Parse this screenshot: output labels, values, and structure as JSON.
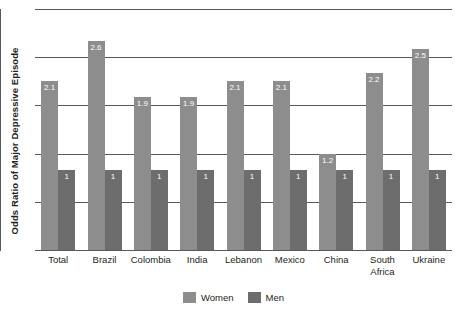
{
  "chart_data": {
    "type": "bar",
    "title": "",
    "subtitle": "",
    "xlabel": "",
    "ylabel": "Odds Ratio of Major Depressive Episode",
    "categories": [
      "Total",
      "Brazil",
      "Colombia",
      "India",
      "Lebanon",
      "Mexico",
      "China",
      "South\nAfrica",
      "Ukraine"
    ],
    "series": [
      {
        "name": "Women",
        "color": "#8d8d8d",
        "values": [
          2.1,
          2.6,
          1.9,
          1.9,
          2.1,
          2.1,
          1.2,
          2.2,
          2.5
        ],
        "labels": [
          "2.1",
          "2.6",
          "1.9",
          "1.9",
          "2.1",
          "2.1",
          "1.2",
          "2.2",
          "2.5"
        ]
      },
      {
        "name": "Men",
        "color": "#6d6d6d",
        "values": [
          1,
          1,
          1,
          1,
          1,
          1,
          1,
          1,
          1
        ],
        "labels": [
          "1",
          "1",
          "1",
          "1",
          "1",
          "1",
          "1",
          "1",
          "1"
        ]
      }
    ],
    "ylim": [
      0,
      3.0
    ],
    "yticks": [
      0,
      0.6,
      1.2,
      1.8,
      2.4,
      3.0
    ],
    "ytick_labels": [
      "",
      "",
      "",
      "",
      "",
      ""
    ],
    "grid": true,
    "legend_position": "bottom-center",
    "legend": [
      "Women",
      "Men"
    ],
    "annotations": []
  },
  "legend": {
    "women_label": "Women",
    "men_label": "Men"
  }
}
